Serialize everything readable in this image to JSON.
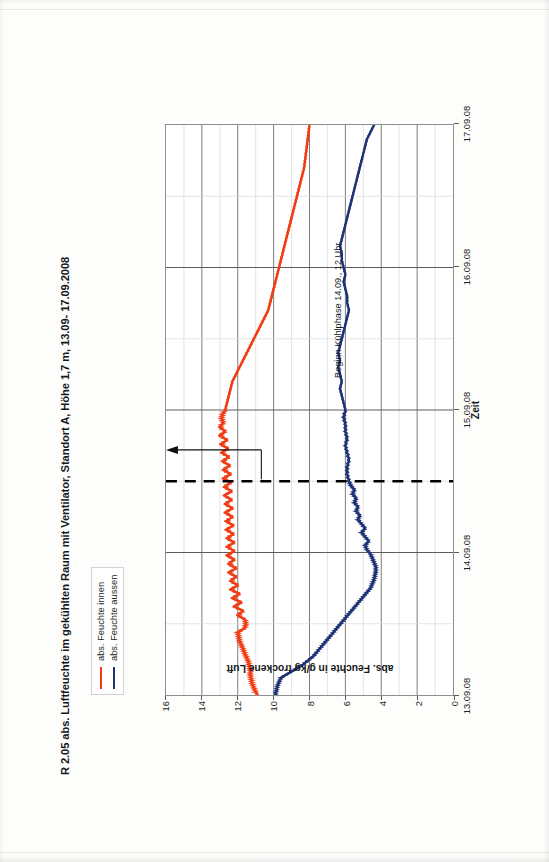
{
  "document": {
    "kind": "scanned-report-page",
    "orientation": "landscape-chart-on-portrait-page"
  },
  "chart_data": {
    "type": "line",
    "title": "R 2.05 abs. Luftfeuchte im gekühlten Raum mit Ventilator, Standort A, Höhe 1,7 m, 13.09- 17.09.2008",
    "xlabel": "Zeit",
    "ylabel": "abs. Feuchte in g/kg trockene Luft",
    "ylim": [
      0,
      16
    ],
    "yticks": [
      0,
      2,
      4,
      6,
      8,
      10,
      12,
      14,
      16
    ],
    "xticks": [
      "13.09.08",
      "14.09.08",
      "15.09.08",
      "16.09.08",
      "17.09.08"
    ],
    "xlim": [
      "13.09.08",
      "17.09.08"
    ],
    "grid": "major-vertical-daily-and-horizontal-2g",
    "legend_position": "above-plot-left",
    "annotations": [
      {
        "text": "Beginn Kühlphase 14.09., 12 Uhr",
        "x": "14.09.08 12:00",
        "marker": "vertical dashed line with arrow"
      }
    ],
    "series": [
      {
        "name": "abs. Feuchte innen",
        "color": "#F03C14",
        "x": [
          0.0,
          0.02,
          0.05,
          0.08,
          0.11,
          0.14,
          0.17,
          0.2,
          0.23,
          0.26,
          0.29,
          0.32,
          0.35,
          0.38,
          0.41,
          0.44,
          0.47,
          0.5,
          0.53,
          0.56,
          0.59,
          0.62,
          0.65,
          0.68,
          0.71,
          0.74,
          0.77,
          0.8,
          0.83,
          0.86,
          0.89,
          0.92,
          0.95,
          0.98,
          1.01,
          1.04,
          1.07,
          1.1,
          1.13,
          1.16,
          1.19,
          1.22,
          1.25,
          1.28,
          1.31,
          1.34,
          1.37,
          1.4,
          1.43,
          1.46,
          1.49,
          1.52,
          1.55,
          1.58,
          1.61,
          1.64,
          1.67,
          1.7,
          1.73,
          1.76,
          1.79,
          1.82,
          1.85,
          1.88,
          1.91,
          1.94,
          1.97,
          2.0,
          2.05,
          2.1,
          2.15,
          2.2,
          2.25,
          2.3,
          2.35,
          2.4,
          2.45,
          2.5,
          2.55,
          2.6,
          2.65,
          2.7,
          2.75,
          2.8,
          2.85,
          2.9,
          2.95,
          3.0,
          3.05,
          3.1,
          3.15,
          3.2,
          3.25,
          3.3,
          3.35,
          3.4,
          3.45,
          3.5,
          3.55,
          3.6,
          3.65,
          3.7,
          3.75,
          3.8,
          3.85,
          3.9,
          3.95,
          4.0
        ],
        "y": [
          10.9,
          11.0,
          11.1,
          11.2,
          11.25,
          11.3,
          11.3,
          11.35,
          11.4,
          11.5,
          11.6,
          11.7,
          11.8,
          11.9,
          11.95,
          12.0,
          11.6,
          11.55,
          11.6,
          12.0,
          11.7,
          12.2,
          11.8,
          12.3,
          11.9,
          12.4,
          12.0,
          12.4,
          12.1,
          12.5,
          12.1,
          12.5,
          12.2,
          12.6,
          12.2,
          12.6,
          12.2,
          12.6,
          12.25,
          12.65,
          12.25,
          12.65,
          12.3,
          12.7,
          12.3,
          12.7,
          12.35,
          12.75,
          12.35,
          12.75,
          12.4,
          12.8,
          12.4,
          12.8,
          12.45,
          12.85,
          12.5,
          12.9,
          12.55,
          12.95,
          12.6,
          13.0,
          12.7,
          13.0,
          12.8,
          12.9,
          12.85,
          12.7,
          12.6,
          12.5,
          12.4,
          12.3,
          12.1,
          11.9,
          11.7,
          11.5,
          11.3,
          11.1,
          10.9,
          10.7,
          10.5,
          10.3,
          10.2,
          10.1,
          10.0,
          9.9,
          9.8,
          9.7,
          9.6,
          9.5,
          9.4,
          9.3,
          9.2,
          9.1,
          9.0,
          8.9,
          8.8,
          8.7,
          8.6,
          8.5,
          8.4,
          8.3,
          8.25,
          8.2,
          8.15,
          8.1,
          8.05,
          8.0
        ]
      },
      {
        "name": "abs. Feuchte aussen",
        "color": "#1F3377",
        "x": [
          0.0,
          0.03,
          0.06,
          0.09,
          0.12,
          0.15,
          0.18,
          0.21,
          0.24,
          0.27,
          0.3,
          0.33,
          0.36,
          0.39,
          0.42,
          0.45,
          0.48,
          0.51,
          0.54,
          0.57,
          0.6,
          0.63,
          0.66,
          0.69,
          0.72,
          0.75,
          0.78,
          0.81,
          0.84,
          0.87,
          0.9,
          0.93,
          0.96,
          0.99,
          1.02,
          1.05,
          1.08,
          1.11,
          1.14,
          1.17,
          1.2,
          1.23,
          1.26,
          1.29,
          1.32,
          1.35,
          1.38,
          1.41,
          1.44,
          1.47,
          1.5,
          1.55,
          1.6,
          1.65,
          1.7,
          1.75,
          1.8,
          1.85,
          1.9,
          1.95,
          2.0,
          2.05,
          2.1,
          2.15,
          2.2,
          2.25,
          2.3,
          2.35,
          2.4,
          2.45,
          2.5,
          2.55,
          2.6,
          2.65,
          2.7,
          2.75,
          2.8,
          2.85,
          2.9,
          2.95,
          3.0,
          3.05,
          3.1,
          3.15,
          3.2,
          3.25,
          3.3,
          3.35,
          3.4,
          3.45,
          3.5,
          3.55,
          3.6,
          3.65,
          3.7,
          3.75,
          3.8,
          3.85,
          3.9,
          3.95,
          4.0
        ],
        "y": [
          9.9,
          9.85,
          9.8,
          9.7,
          9.6,
          9.2,
          8.8,
          8.4,
          8.1,
          7.8,
          7.6,
          7.4,
          7.2,
          7.0,
          6.8,
          6.6,
          6.4,
          6.2,
          6.0,
          5.8,
          5.6,
          5.4,
          5.2,
          5.0,
          4.8,
          4.6,
          4.5,
          4.4,
          4.35,
          4.3,
          4.3,
          4.4,
          4.5,
          4.6,
          4.8,
          4.9,
          4.7,
          4.9,
          5.1,
          4.9,
          5.1,
          5.3,
          5.2,
          5.4,
          5.3,
          5.5,
          5.4,
          5.6,
          5.5,
          5.7,
          5.8,
          5.9,
          5.9,
          5.8,
          5.9,
          6.0,
          5.9,
          6.0,
          6.0,
          6.1,
          6.0,
          6.1,
          6.2,
          6.3,
          6.2,
          6.3,
          6.4,
          6.3,
          6.4,
          6.3,
          6.2,
          6.1,
          6.0,
          5.9,
          5.8,
          5.9,
          5.9,
          6.0,
          6.1,
          6.0,
          6.1,
          6.2,
          6.2,
          6.3,
          6.2,
          6.1,
          6.0,
          5.9,
          5.8,
          5.7,
          5.6,
          5.5,
          5.4,
          5.3,
          5.2,
          5.1,
          5.0,
          4.9,
          4.8,
          4.6,
          4.4
        ]
      }
    ]
  },
  "legend": {
    "items": [
      {
        "label": "abs. Feuchte innen",
        "color": "#F03C14"
      },
      {
        "label": "abs. Feuchte aussen",
        "color": "#1F3377"
      }
    ]
  },
  "colors": {
    "inside": "#F03C14",
    "outside": "#1F3377",
    "grid_major": "#6e6e6e",
    "grid_minor": "#d8d8d8",
    "axis": "#8e8e8e",
    "text": "#16191c"
  }
}
